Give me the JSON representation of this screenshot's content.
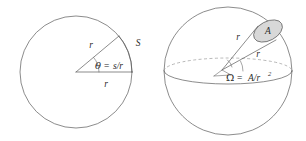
{
  "figure": {
    "background_color": "#ffffff",
    "stroke_color": "#5a5a5a",
    "patch_fill_color": "#d8d8d8",
    "label_color": "#2b2b2b"
  },
  "left_diagram": {
    "name": "plane-angle-circle",
    "radius_label_horizontal": "r",
    "radius_label_oblique": "r",
    "arc_label": "S",
    "angle_symbol": "θ",
    "equals": "=",
    "angle_value": "s/r",
    "angle_equation": "θ = s/r"
  },
  "right_diagram": {
    "name": "solid-angle-sphere",
    "patch_label": "A",
    "radius_label_upper": "r",
    "radius_label_lower": "r",
    "omega_symbol": "Ω",
    "equals": "=",
    "omega_numerator": "A/r",
    "omega_exponent": "2",
    "omega_equation": "Ω = A/r²"
  }
}
